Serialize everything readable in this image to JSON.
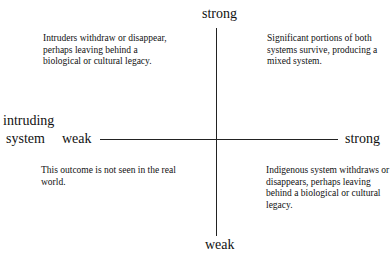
{
  "diagram": {
    "type": "quadrant",
    "vertical_axis": {
      "top_label": "strong",
      "bottom_label": "weak"
    },
    "horizontal_axis": {
      "title_line1": "intruding",
      "title_line2": "system",
      "left_label": "weak",
      "right_label": "strong"
    },
    "quadrants": {
      "top_left": "Intruders withdraw or disappear, perhaps leaving behind a biological or cultural legacy.",
      "top_right": "Significant portions of both systems survive, producing a mixed system.",
      "bottom_left": "This outcome is not seen in the real world.",
      "bottom_right": "Indigenous system withdraws or disappears, perhaps leaving behind a biological or cultural legacy."
    }
  }
}
